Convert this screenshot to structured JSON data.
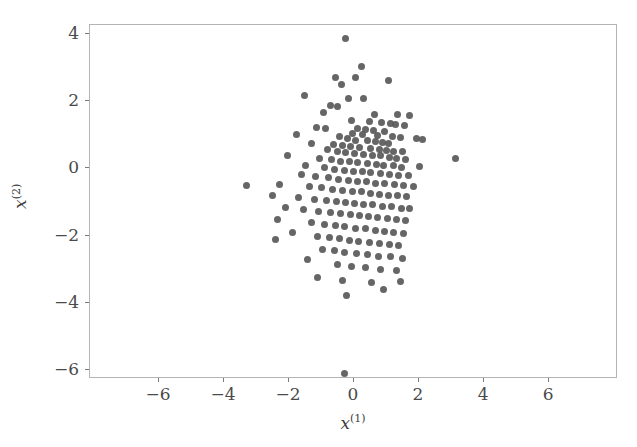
{
  "chart_data": {
    "type": "scatter",
    "title": "",
    "xlabel": "x(1)",
    "ylabel": "x(2)",
    "xlabel_base": "x",
    "xlabel_sup": "(1)",
    "ylabel_base": "x",
    "ylabel_sup": "(2)",
    "xlim": [
      -8.12,
      8.12
    ],
    "ylim": [
      -6.28,
      4.28
    ],
    "xticks": [
      -6,
      -4,
      -2,
      0,
      2,
      4,
      6
    ],
    "xticklabels": [
      "−6",
      "−4",
      "−2",
      "0",
      "2",
      "4",
      "6"
    ],
    "yticks": [
      4,
      2,
      0,
      -2,
      -4,
      -6
    ],
    "yticklabels": [
      "4",
      "2",
      "0",
      "−2",
      "−4",
      "−6"
    ],
    "grid": false,
    "legend": null,
    "marker_color": "#595959",
    "marker_size_px": 7,
    "frame_color": "#b4b4b4",
    "background": "#ffffff",
    "n_points": 180,
    "series": [
      {
        "name": "samples",
        "color": "#595959",
        "points": [
          [
            -0.27,
            3.87
          ],
          [
            0.22,
            3.05
          ],
          [
            -0.58,
            2.72
          ],
          [
            -0.38,
            2.52
          ],
          [
            0.05,
            2.7
          ],
          [
            1.05,
            2.62
          ],
          [
            -1.52,
            2.18
          ],
          [
            -0.18,
            2.1
          ],
          [
            0.3,
            2.08
          ],
          [
            -0.72,
            1.88
          ],
          [
            -0.5,
            1.84
          ],
          [
            -0.95,
            1.66
          ],
          [
            0.62,
            1.62
          ],
          [
            1.35,
            1.6
          ],
          [
            1.7,
            1.58
          ],
          [
            -0.08,
            1.42
          ],
          [
            0.48,
            1.4
          ],
          [
            0.85,
            1.38
          ],
          [
            1.12,
            1.35
          ],
          [
            1.28,
            1.3
          ],
          [
            1.55,
            1.28
          ],
          [
            -1.15,
            1.22
          ],
          [
            -0.88,
            1.18
          ],
          [
            0.12,
            1.2
          ],
          [
            0.34,
            1.16
          ],
          [
            0.6,
            1.12
          ],
          [
            0.95,
            1.1
          ],
          [
            -1.78,
            1.02
          ],
          [
            -0.05,
            1.05
          ],
          [
            0.25,
            1.0
          ],
          [
            0.72,
            0.98
          ],
          [
            1.18,
            0.96
          ],
          [
            1.42,
            0.92
          ],
          [
            1.92,
            0.9
          ],
          [
            2.1,
            0.86
          ],
          [
            -0.44,
            0.94
          ],
          [
            -0.2,
            0.88
          ],
          [
            0.05,
            0.84
          ],
          [
            0.42,
            0.82
          ],
          [
            0.65,
            0.8
          ],
          [
            0.88,
            0.78
          ],
          [
            1.05,
            0.74
          ],
          [
            -1.3,
            0.76
          ],
          [
            -0.62,
            0.72
          ],
          [
            -0.35,
            0.68
          ],
          [
            -0.1,
            0.66
          ],
          [
            0.18,
            0.62
          ],
          [
            0.5,
            0.6
          ],
          [
            0.78,
            0.58
          ],
          [
            1.0,
            0.55
          ],
          [
            1.22,
            0.52
          ],
          [
            1.48,
            0.5
          ],
          [
            -0.82,
            0.58
          ],
          [
            -0.52,
            0.52
          ],
          [
            -0.25,
            0.48
          ],
          [
            0.02,
            0.46
          ],
          [
            0.3,
            0.42
          ],
          [
            0.58,
            0.4
          ],
          [
            0.82,
            0.38
          ],
          [
            1.1,
            0.34
          ],
          [
            1.32,
            0.3
          ],
          [
            1.58,
            0.28
          ],
          [
            3.12,
            0.3
          ],
          [
            -2.05,
            0.38
          ],
          [
            -1.05,
            0.3
          ],
          [
            -0.7,
            0.26
          ],
          [
            -0.42,
            0.22
          ],
          [
            -0.15,
            0.2
          ],
          [
            0.12,
            0.18
          ],
          [
            0.4,
            0.14
          ],
          [
            0.68,
            0.12
          ],
          [
            0.92,
            0.1
          ],
          [
            1.2,
            0.08
          ],
          [
            1.45,
            0.04
          ],
          [
            2.02,
            0.06
          ],
          [
            -1.48,
            0.08
          ],
          [
            -0.92,
            0.02
          ],
          [
            -0.6,
            -0.02
          ],
          [
            -0.3,
            -0.05
          ],
          [
            -0.02,
            -0.08
          ],
          [
            0.25,
            -0.1
          ],
          [
            0.52,
            -0.12
          ],
          [
            0.8,
            -0.15
          ],
          [
            1.08,
            -0.18
          ],
          [
            1.38,
            -0.2
          ],
          [
            1.68,
            -0.22
          ],
          [
            -1.62,
            -0.18
          ],
          [
            -1.18,
            -0.24
          ],
          [
            -0.78,
            -0.28
          ],
          [
            -0.48,
            -0.32
          ],
          [
            -0.18,
            -0.35
          ],
          [
            0.1,
            -0.38
          ],
          [
            0.38,
            -0.4
          ],
          [
            0.66,
            -0.44
          ],
          [
            0.95,
            -0.46
          ],
          [
            1.25,
            -0.48
          ],
          [
            1.52,
            -0.52
          ],
          [
            1.82,
            -0.55
          ],
          [
            -3.32,
            -0.52
          ],
          [
            -2.28,
            -0.48
          ],
          [
            -1.38,
            -0.55
          ],
          [
            -1.0,
            -0.58
          ],
          [
            -0.65,
            -0.62
          ],
          [
            -0.35,
            -0.65
          ],
          [
            -0.05,
            -0.68
          ],
          [
            0.22,
            -0.7
          ],
          [
            0.5,
            -0.74
          ],
          [
            0.78,
            -0.78
          ],
          [
            1.05,
            -0.8
          ],
          [
            1.35,
            -0.82
          ],
          [
            1.62,
            -0.85
          ],
          [
            -2.52,
            -0.82
          ],
          [
            -1.72,
            -0.88
          ],
          [
            -1.22,
            -0.92
          ],
          [
            -0.85,
            -0.95
          ],
          [
            -0.55,
            -0.98
          ],
          [
            -0.25,
            -1.0
          ],
          [
            0.02,
            -1.04
          ],
          [
            0.3,
            -1.06
          ],
          [
            0.58,
            -1.08
          ],
          [
            0.88,
            -1.12
          ],
          [
            1.15,
            -1.14
          ],
          [
            1.45,
            -1.18
          ],
          [
            1.72,
            -1.2
          ],
          [
            -2.1,
            -1.15
          ],
          [
            -1.55,
            -1.22
          ],
          [
            -1.08,
            -1.28
          ],
          [
            -0.72,
            -1.3
          ],
          [
            -0.42,
            -1.34
          ],
          [
            -0.12,
            -1.36
          ],
          [
            0.18,
            -1.4
          ],
          [
            0.45,
            -1.42
          ],
          [
            0.72,
            -1.46
          ],
          [
            1.02,
            -1.48
          ],
          [
            1.3,
            -1.52
          ],
          [
            1.58,
            -1.55
          ],
          [
            -2.35,
            -1.52
          ],
          [
            -1.3,
            -1.62
          ],
          [
            -0.92,
            -1.66
          ],
          [
            -0.58,
            -1.7
          ],
          [
            -0.28,
            -1.74
          ],
          [
            0.05,
            -1.78
          ],
          [
            0.35,
            -1.8
          ],
          [
            0.65,
            -1.84
          ],
          [
            0.95,
            -1.88
          ],
          [
            1.22,
            -1.9
          ],
          [
            1.52,
            -1.94
          ],
          [
            -1.88,
            -1.92
          ],
          [
            -1.12,
            -2.02
          ],
          [
            -0.75,
            -2.06
          ],
          [
            -0.45,
            -2.1
          ],
          [
            -0.15,
            -2.14
          ],
          [
            0.15,
            -2.18
          ],
          [
            0.48,
            -2.2
          ],
          [
            0.78,
            -2.24
          ],
          [
            1.08,
            -2.28
          ],
          [
            1.38,
            -2.3
          ],
          [
            -2.42,
            -2.12
          ],
          [
            -0.98,
            -2.42
          ],
          [
            -0.6,
            -2.46
          ],
          [
            -0.28,
            -2.5
          ],
          [
            0.08,
            -2.54
          ],
          [
            0.42,
            -2.58
          ],
          [
            0.75,
            -2.62
          ],
          [
            1.12,
            -2.64
          ],
          [
            1.5,
            -2.68
          ],
          [
            -1.42,
            -2.72
          ],
          [
            -0.52,
            -2.86
          ],
          [
            -0.08,
            -2.92
          ],
          [
            0.35,
            -2.96
          ],
          [
            0.82,
            -3.0
          ],
          [
            1.3,
            -3.04
          ],
          [
            -1.12,
            -3.26
          ],
          [
            -0.35,
            -3.34
          ],
          [
            0.55,
            -3.4
          ],
          [
            1.42,
            -3.38
          ],
          [
            -0.22,
            -3.78
          ],
          [
            0.92,
            -3.62
          ],
          [
            -0.3,
            -6.12
          ]
        ]
      }
    ]
  }
}
